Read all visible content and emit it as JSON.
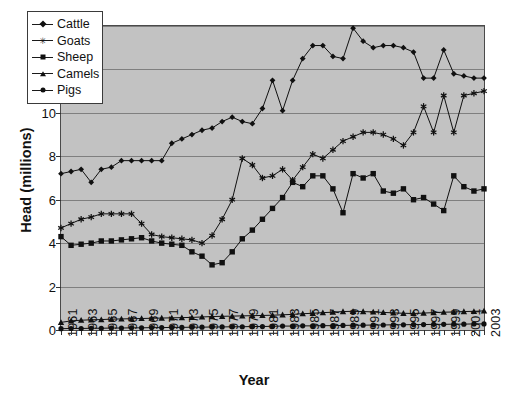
{
  "chart_data": {
    "type": "line",
    "title": "",
    "xlabel": "Year",
    "ylabel": "Head (millions)",
    "xlim": [
      1961,
      2003
    ],
    "ylim": [
      0,
      14
    ],
    "yticks": [
      0,
      2,
      4,
      6,
      8,
      10,
      12,
      14
    ],
    "grid": true,
    "legend_position": "top-left-inside",
    "plot_background": "#c2c2c2",
    "line_color": "#101010",
    "x": [
      1961,
      1962,
      1963,
      1964,
      1965,
      1966,
      1967,
      1968,
      1969,
      1970,
      1971,
      1972,
      1973,
      1974,
      1975,
      1976,
      1977,
      1978,
      1979,
      1980,
      1981,
      1982,
      1983,
      1984,
      1985,
      1986,
      1987,
      1988,
      1989,
      1990,
      1991,
      1992,
      1993,
      1994,
      1995,
      1996,
      1997,
      1998,
      1999,
      2000,
      2001,
      2002,
      2003
    ],
    "xtick_labels": [
      "1961",
      "1963",
      "1965",
      "1967",
      "1969",
      "1971",
      "1973",
      "1975",
      "1977",
      "1979",
      "1981",
      "1983",
      "1985",
      "1987",
      "1989",
      "1991",
      "1993",
      "1995",
      "1997",
      "1999",
      "2001",
      "2003"
    ],
    "series": [
      {
        "name": "Cattle",
        "marker": "diamond",
        "values": [
          7.2,
          7.3,
          7.4,
          6.8,
          7.4,
          7.5,
          7.8,
          7.8,
          7.8,
          7.8,
          7.8,
          8.6,
          8.8,
          9.0,
          9.2,
          9.3,
          9.6,
          9.8,
          9.6,
          9.5,
          10.2,
          11.5,
          10.1,
          11.5,
          12.5,
          13.1,
          13.1,
          12.6,
          12.5,
          13.9,
          13.3,
          13.0,
          13.1,
          13.1,
          13.0,
          12.8,
          11.6,
          11.6,
          12.9,
          11.8,
          11.7,
          11.6,
          11.6
        ]
      },
      {
        "name": "Goats",
        "marker": "star",
        "values": [
          4.7,
          4.9,
          5.1,
          5.2,
          5.35,
          5.35,
          5.35,
          5.35,
          4.9,
          4.4,
          4.3,
          4.25,
          4.2,
          4.15,
          4.0,
          4.35,
          5.1,
          6.0,
          7.9,
          7.6,
          7.0,
          7.1,
          7.4,
          6.9,
          7.5,
          8.1,
          7.9,
          8.3,
          8.7,
          8.9,
          9.1,
          9.1,
          9.0,
          8.8,
          8.5,
          9.1,
          10.3,
          9.1,
          10.8,
          9.1,
          10.8,
          10.9,
          11.0
        ]
      },
      {
        "name": "Sheep",
        "marker": "square",
        "values": [
          4.3,
          3.9,
          3.95,
          4.0,
          4.1,
          4.1,
          4.15,
          4.2,
          4.25,
          4.1,
          4.0,
          3.95,
          3.9,
          3.6,
          3.4,
          3.0,
          3.1,
          3.6,
          4.2,
          4.6,
          5.1,
          5.6,
          6.1,
          6.8,
          6.6,
          7.1,
          7.1,
          6.5,
          5.4,
          7.2,
          7.0,
          7.2,
          6.4,
          6.3,
          6.5,
          6.0,
          6.1,
          5.8,
          5.5,
          7.1,
          6.6,
          6.4,
          6.5
        ]
      },
      {
        "name": "Camels",
        "marker": "triangle",
        "values": [
          0.35,
          0.42,
          0.45,
          0.47,
          0.48,
          0.5,
          0.51,
          0.52,
          0.53,
          0.54,
          0.55,
          0.56,
          0.57,
          0.58,
          0.6,
          0.62,
          0.63,
          0.64,
          0.65,
          0.66,
          0.67,
          0.68,
          0.7,
          0.72,
          0.75,
          0.77,
          0.8,
          0.82,
          0.85,
          0.86,
          0.85,
          0.83,
          0.81,
          0.79,
          0.77,
          0.76,
          0.78,
          0.8,
          0.82,
          0.83,
          0.85,
          0.86,
          0.88
        ]
      },
      {
        "name": "Pigs",
        "marker": "circle",
        "values": [
          0.06,
          0.07,
          0.07,
          0.08,
          0.08,
          0.09,
          0.09,
          0.1,
          0.1,
          0.11,
          0.11,
          0.12,
          0.12,
          0.13,
          0.13,
          0.14,
          0.14,
          0.15,
          0.15,
          0.16,
          0.16,
          0.17,
          0.18,
          0.18,
          0.19,
          0.19,
          0.2,
          0.2,
          0.21,
          0.22,
          0.22,
          0.23,
          0.23,
          0.24,
          0.24,
          0.25,
          0.25,
          0.26,
          0.26,
          0.27,
          0.27,
          0.28,
          0.28
        ]
      }
    ]
  },
  "legend": {
    "items": [
      {
        "label": "Cattle"
      },
      {
        "label": "Goats"
      },
      {
        "label": "Sheep"
      },
      {
        "label": "Camels"
      },
      {
        "label": "Pigs"
      }
    ]
  }
}
